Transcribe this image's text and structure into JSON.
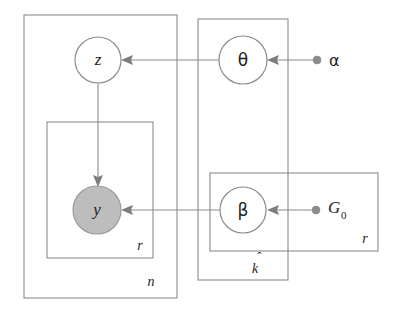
{
  "diagram": {
    "type": "probabilistic-graphical-model-plate-notation",
    "title": "",
    "background_color": "#ffffff",
    "stroke_color": "#8b8b8b",
    "shaded_node_fill": "#bdbdbd",
    "nodes": [
      {
        "id": "z",
        "label": "z",
        "kind": "latent-variable",
        "shaded": false,
        "cx": 98,
        "cy": 60,
        "r": 23
      },
      {
        "id": "theta",
        "label": "θ",
        "kind": "latent-variable",
        "shaded": false,
        "cx": 243,
        "cy": 60,
        "r": 24
      },
      {
        "id": "y",
        "label": "y",
        "kind": "observed-variable",
        "shaded": true,
        "cx": 97,
        "cy": 210,
        "r": 24
      },
      {
        "id": "beta",
        "label": "β",
        "kind": "latent-variable",
        "shaded": false,
        "cx": 243,
        "cy": 210,
        "r": 23
      }
    ],
    "hyperparameters": [
      {
        "id": "alpha",
        "label": "α",
        "subscript": "",
        "dot_x": 317,
        "dot_y": 60,
        "label_x": 329,
        "label_y": 60
      },
      {
        "id": "G0",
        "label": "G",
        "subscript": "0",
        "dot_x": 316,
        "dot_y": 210,
        "label_x": 328,
        "label_y": 209
      }
    ],
    "edges": [
      {
        "id": "theta-to-z",
        "from": "theta",
        "to": "z",
        "direction": "right-to-left"
      },
      {
        "id": "z-to-y",
        "from": "z",
        "to": "y",
        "direction": "top-to-bottom"
      },
      {
        "id": "beta-to-y",
        "from": "beta",
        "to": "y",
        "direction": "right-to-left"
      },
      {
        "id": "alpha-to-theta",
        "from": "alpha",
        "to": "theta",
        "direction": "right-to-left"
      },
      {
        "id": "G0-to-beta",
        "from": "G0",
        "to": "beta",
        "direction": "right-to-left"
      }
    ],
    "plates": [
      {
        "id": "plate-n",
        "label": "n",
        "hat": false,
        "x": 24,
        "y": 15,
        "width": 153,
        "height": 283,
        "label_x": 151,
        "label_y": 283
      },
      {
        "id": "plate-r-observations",
        "label": "r",
        "hat": false,
        "x": 47,
        "y": 122,
        "width": 106,
        "height": 136,
        "label_x": 140,
        "label_y": 247
      },
      {
        "id": "plate-k-hat",
        "label": "k",
        "hat": true,
        "x": 198,
        "y": 19,
        "width": 90,
        "height": 261,
        "label_x": 255,
        "label_y": 268
      },
      {
        "id": "plate-r-components",
        "label": "r",
        "hat": false,
        "x": 210,
        "y": 173,
        "width": 168,
        "height": 78,
        "label_x": 365,
        "label_y": 240
      }
    ]
  }
}
